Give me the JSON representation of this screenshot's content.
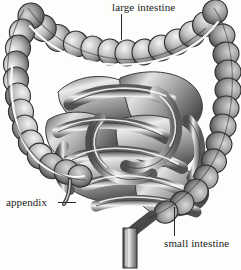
{
  "figure": {
    "background_color": "#fdfdfc",
    "ink_color": "#2a2a2a",
    "style": "grayscale engraving / airbrush medical illustration",
    "width": 241,
    "height": 270
  },
  "labels": [
    {
      "id": "large-intestine",
      "text": "large intestine",
      "leader": "vertical line descending to transverse colon"
    },
    {
      "id": "appendix",
      "text": "appendix",
      "leader": "horizontal line pointing right to cecum"
    },
    {
      "id": "small-intestine",
      "text": "small intestine",
      "leader": "vertical line ascending to ileal coils"
    }
  ],
  "anatomy": {
    "parts": [
      "transverse colon",
      "ascending colon",
      "descending colon",
      "cecum",
      "appendix",
      "small intestine coils",
      "rectum"
    ]
  },
  "palette": {
    "paper": "#fdfdfc",
    "highlight": "#ffffff",
    "mid_tone": "#9a9a9a",
    "shadow": "#4a4a4a",
    "outline": "#2f2f2f"
  }
}
